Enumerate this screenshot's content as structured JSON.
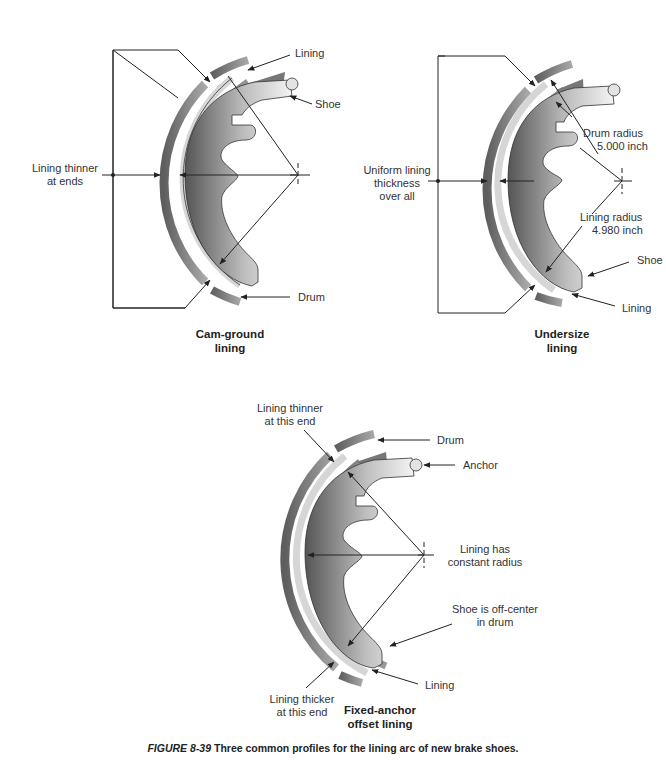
{
  "figure": {
    "number": "FIGURE 8-39",
    "caption": " Three common profiles for the lining arc of new brake shoes."
  },
  "panels": [
    {
      "id": "cam-ground",
      "title_line1": "Cam-ground",
      "title_line2": "lining",
      "labels": {
        "lining": "Lining",
        "shoe": "Shoe",
        "drum": "Drum",
        "note_line1": "Lining thinner",
        "note_line2": "at ends"
      }
    },
    {
      "id": "undersize",
      "title_line1": "Undersize",
      "title_line2": "lining",
      "labels": {
        "note_line1": "Uniform lining",
        "note_line2": "thickness",
        "note_line3": "over all",
        "drum_radius_line1": "Drum radius",
        "drum_radius_line2": "5.000 inch",
        "lining_radius_line1": "Lining radius",
        "lining_radius_line2": "4.980 inch",
        "shoe": "Shoe",
        "lining": "Lining"
      }
    },
    {
      "id": "fixed-anchor",
      "title_line1": "Fixed-anchor",
      "title_line2": "offset lining",
      "labels": {
        "thinner_line1": "Lining thinner",
        "thinner_line2": "at this end",
        "drum": "Drum",
        "anchor": "Anchor",
        "radius_line1": "Lining has",
        "radius_line2": "constant radius",
        "offcenter_line1": "Shoe is off-center",
        "offcenter_line2": "in drum",
        "lining": "Lining",
        "thicker_line1": "Lining thicker",
        "thicker_line2": "at this end"
      }
    }
  ],
  "colors": {
    "drum": "#8a8a8a",
    "lining": "#d4d4d4",
    "shoe_dark": "#6e6e6e",
    "shoe_light": "#f2f2f2",
    "line": "#222222"
  }
}
